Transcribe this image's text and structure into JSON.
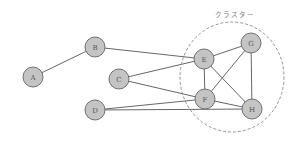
{
  "diagram": {
    "type": "graph",
    "cluster": {
      "label": "クラスター",
      "cx": 232,
      "cy": 77,
      "rx": 52,
      "ry": 55,
      "members": [
        "E",
        "F",
        "G",
        "H"
      ]
    },
    "nodes": [
      {
        "id": "A",
        "label": "A",
        "x": 33,
        "y": 77
      },
      {
        "id": "B",
        "label": "B",
        "x": 95,
        "y": 47
      },
      {
        "id": "C",
        "label": "C",
        "x": 119,
        "y": 79
      },
      {
        "id": "D",
        "label": "D",
        "x": 95,
        "y": 110
      },
      {
        "id": "E",
        "label": "E",
        "x": 204,
        "y": 59
      },
      {
        "id": "F",
        "label": "F",
        "x": 205,
        "y": 99
      },
      {
        "id": "G",
        "label": "G",
        "x": 251,
        "y": 43
      },
      {
        "id": "H",
        "label": "H",
        "x": 252,
        "y": 109
      }
    ],
    "node_radius": 10,
    "edges": [
      [
        "A",
        "B"
      ],
      [
        "B",
        "E"
      ],
      [
        "C",
        "E"
      ],
      [
        "C",
        "F"
      ],
      [
        "D",
        "F"
      ],
      [
        "D",
        "H"
      ],
      [
        "E",
        "G"
      ],
      [
        "E",
        "F"
      ],
      [
        "E",
        "H"
      ],
      [
        "F",
        "G"
      ],
      [
        "F",
        "H"
      ],
      [
        "G",
        "H"
      ]
    ],
    "colors": {
      "node_fill": "#c4c4c4",
      "node_stroke": "#707070",
      "edge": "#666666",
      "cluster_stroke": "#888888"
    }
  }
}
